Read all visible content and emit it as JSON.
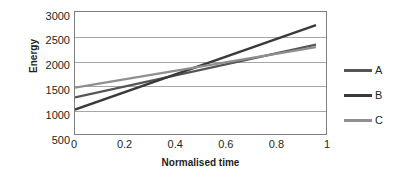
{
  "chart_data": {
    "type": "line",
    "title": "",
    "xlabel": "Normalised time",
    "ylabel": "Energy",
    "xlim": [
      0,
      1
    ],
    "ylim": [
      500,
      3000
    ],
    "grid": true,
    "legend_position": "right",
    "x_ticks": [
      "0",
      "0.2",
      "0.4",
      "0.6",
      "0.8",
      "1"
    ],
    "x_tick_values": [
      0,
      0.2,
      0.4,
      0.6,
      0.8,
      1
    ],
    "y_ticks": [
      "3000",
      "2500",
      "2000",
      "1500",
      "1000",
      "500"
    ],
    "y_tick_values": [
      3000,
      2500,
      2000,
      1500,
      1000,
      500
    ],
    "x": [
      0,
      0.96
    ],
    "series": [
      {
        "name": "A",
        "color": "#555555",
        "values": [
          1250,
          2330
        ],
        "points": [
          [
            0,
            1250
          ],
          [
            0.96,
            2330
          ]
        ]
      },
      {
        "name": "B",
        "color": "#3a3a3a",
        "values": [
          1000,
          2730
        ],
        "points": [
          [
            0,
            1000
          ],
          [
            0.96,
            2730
          ]
        ]
      },
      {
        "name": "C",
        "color": "#8f8f8f",
        "values": [
          1450,
          2280
        ],
        "points": [
          [
            0,
            1450
          ],
          [
            0.96,
            2280
          ]
        ]
      }
    ]
  },
  "legend": {
    "items": [
      {
        "label": "A",
        "color": "#555555"
      },
      {
        "label": "B",
        "color": "#3a3a3a"
      },
      {
        "label": "C",
        "color": "#8f8f8f"
      }
    ]
  },
  "axes": {
    "y_title": "Energy",
    "x_title": "Normalised time"
  },
  "colors": {
    "gridline": "#a6a6a6",
    "plot_border": "#7f7f7f",
    "text": "#231f20",
    "background": "#ffffff"
  }
}
